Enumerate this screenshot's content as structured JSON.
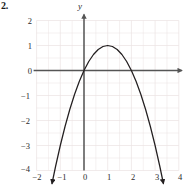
{
  "problem": {
    "label": "2."
  },
  "chart_data": {
    "type": "line",
    "title": "",
    "xlabel": "",
    "ylabel": "y",
    "axis_labels": {
      "x": "",
      "y": "y"
    },
    "xlim": [
      -2,
      4
    ],
    "ylim": [
      -4,
      2
    ],
    "grid": true,
    "grid_step_x": 0.5,
    "grid_step_y": 0.5,
    "legend": "none",
    "xticks": [
      -2,
      -1,
      0,
      1,
      2,
      3,
      4
    ],
    "xticklabels": [
      "−2",
      "−1",
      "0",
      "1",
      "2",
      "3",
      "4"
    ],
    "yticks": [
      2,
      1,
      0,
      -1,
      -2,
      -3,
      -4
    ],
    "yticklabels": [
      "2",
      "1",
      "0",
      "−1",
      "−2",
      "−3",
      "−4"
    ],
    "curve": {
      "name": "parabola",
      "equation": "y = -x^2 + 2x",
      "vertex": [
        1,
        1
      ],
      "roots": [
        0,
        2
      ],
      "opens": "down",
      "domain_drawn": [
        -1.35,
        3.35
      ],
      "arrow_start": [
        -1.35,
        -4
      ],
      "arrow_end": [
        3.35,
        -4
      ],
      "x": [
        -1.35,
        -1.2,
        -1.0,
        -0.8,
        -0.6,
        -0.4,
        -0.2,
        0.0,
        0.2,
        0.4,
        0.6,
        0.8,
        1.0,
        1.2,
        1.4,
        1.6,
        1.8,
        2.0,
        2.2,
        2.4,
        2.6,
        2.8,
        3.0,
        3.2,
        3.35
      ],
      "y": [
        -4.52,
        -3.84,
        -3.0,
        -2.24,
        -1.56,
        -0.96,
        -0.44,
        0.0,
        0.36,
        0.64,
        0.84,
        0.96,
        1.0,
        0.96,
        0.84,
        0.64,
        0.36,
        0.0,
        -0.44,
        -0.96,
        -1.56,
        -2.24,
        -3.0,
        -3.84,
        -4.52
      ]
    },
    "colors": {
      "curve": "#231f20",
      "axis": "#555555",
      "grid": "#ebe2e2",
      "text": "#2b2b2b"
    }
  },
  "ticks": {
    "y": [
      {
        "value": "2"
      },
      {
        "value": "1"
      },
      {
        "value": "0"
      },
      {
        "value": "−1"
      },
      {
        "value": "−2"
      },
      {
        "value": "−3"
      },
      {
        "value": "−4"
      }
    ],
    "x": [
      {
        "value": "−2"
      },
      {
        "value": "−1"
      },
      {
        "value": "0"
      },
      {
        "value": "1"
      },
      {
        "value": "2"
      },
      {
        "value": "3"
      },
      {
        "value": "4"
      }
    ]
  }
}
